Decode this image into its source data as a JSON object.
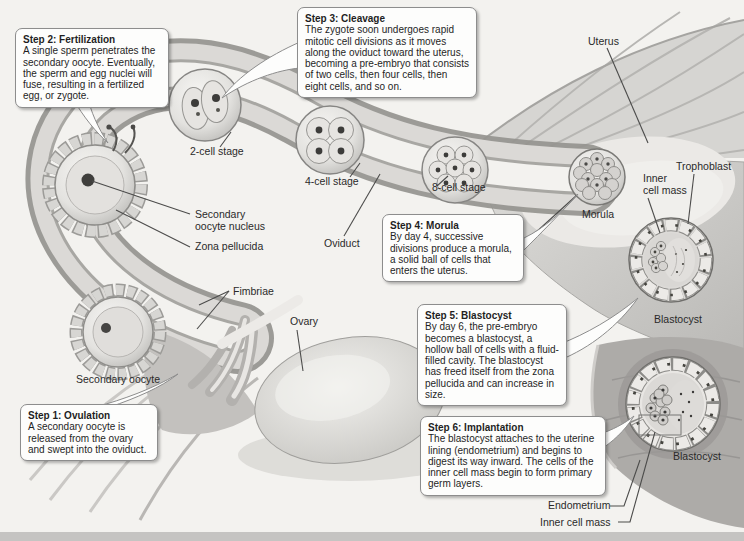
{
  "figure": {
    "steps": [
      {
        "title": "Step 1: Ovulation",
        "body": "A secondary oocyte is released from the ovary and swept into the oviduct."
      },
      {
        "title": "Step 2: Fertilization",
        "body": "A single sperm penetrates the secondary oocyte. Eventually, the sperm and egg nuclei will fuse, resulting in a fertilized egg, or zygote."
      },
      {
        "title": "Step 3: Cleavage",
        "body": "The zygote soon undergoes rapid mitotic cell divisions as it moves along the oviduct toward the uterus, becoming a pre-embryo that consists of two cells, then four cells, then eight cells, and so on."
      },
      {
        "title": "Step 4: Morula",
        "body": "By day 4, successive divisions produce a morula, a solid ball of cells that enters the uterus."
      },
      {
        "title": "Step 5: Blastocyst",
        "body": "By day 6, the pre-embryo becomes a blastocyst, a hollow ball of cells with a fluid-filled cavity. The blastocyst has freed itself from the zona pellucida and can increase in size."
      },
      {
        "title": "Step 6: Implantation",
        "body": "The blastocyst attaches to the uterine lining (endometrium) and begins to digest its way inward. The cells of the inner cell mass begin to form primary germ layers."
      }
    ],
    "labels": {
      "uterus": "Uterus",
      "trophoblast": "Trophoblast",
      "inner_cell_mass_upper": "Inner\ncell mass",
      "morula": "Morula",
      "blastocyst_upper": "Blastocyst",
      "blastocyst_lower": "Blastocyst",
      "two_cell_stage": "2-cell stage",
      "four_cell_stage": "4-cell stage",
      "eight_cell_stage": "8-cell stage",
      "oviduct": "Oviduct",
      "secondary_oocyte_nucleus": "Secondary\noocyte nucleus",
      "zona_pellucida": "Zona pellucida",
      "fimbriae": "Fimbriae",
      "ovary": "Ovary",
      "secondary_oocyte": "Secondary oocyte",
      "endometrium": "Endometrium",
      "inner_cell_mass_lower": "Inner cell mass"
    },
    "colors": {
      "background": "#f3f2ef",
      "callout_bg": "#fdfdfc",
      "callout_border": "#8d8d8d",
      "text": "#1f1f1f",
      "leader_line": "#4c4c4b"
    }
  }
}
